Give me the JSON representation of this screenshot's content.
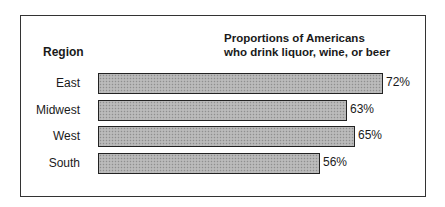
{
  "chart_data": {
    "type": "bar",
    "orientation": "horizontal",
    "title": "Proportions of Americans who drink liquor, wine, or beer",
    "title_lines": [
      "Proportions of Americans",
      "who drink liquor, wine, or beer"
    ],
    "category_header": "Region",
    "categories": [
      "East",
      "Midwest",
      "West",
      "South"
    ],
    "values": [
      72,
      63,
      65,
      56
    ],
    "value_labels": [
      "72%",
      "63%",
      "65%",
      "56%"
    ],
    "xlabel": "",
    "ylabel": "Region",
    "unit": "%",
    "grid": false,
    "legend": null,
    "bar_fill": "#b3b3b3",
    "bar_border": "#222222"
  }
}
